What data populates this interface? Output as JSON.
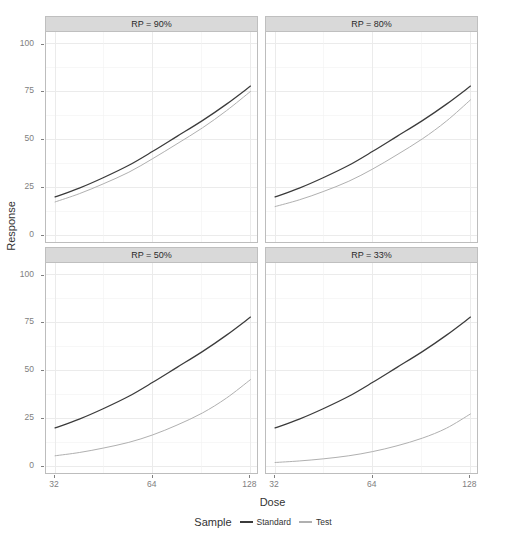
{
  "chart_data": {
    "type": "line",
    "title": "",
    "xlabel": "Dose",
    "ylabel": "Response",
    "xscale": "log2",
    "xlim": [
      30,
      136
    ],
    "ylim": [
      -4,
      106
    ],
    "x_ticks": [
      32,
      64,
      128
    ],
    "x_tick_labels": [
      "32",
      "64",
      "128"
    ],
    "y_ticks": [
      0,
      25,
      50,
      75,
      100
    ],
    "y_tick_labels": [
      "0",
      "25",
      "50",
      "75",
      "100"
    ],
    "grid": true,
    "legend_position": "bottom",
    "legend_title": "Sample",
    "facet_variable": "RP",
    "series_names": [
      "Standard",
      "Test"
    ],
    "series_colors": [
      "#3b3b3b",
      "#b0b0b0"
    ],
    "facets": [
      {
        "label": "RP = 90%",
        "row": 0,
        "col": 0,
        "series": [
          {
            "name": "Standard",
            "color": "#3b3b3b",
            "x": [
              32,
              38,
              45,
              54,
              64,
              76,
              91,
              108,
              128
            ],
            "y": [
              20.0,
              24.6,
              30.0,
              36.5,
              43.8,
              51.6,
              59.8,
              68.4,
              77.8
            ]
          },
          {
            "name": "Test",
            "color": "#b0b0b0",
            "x": [
              32,
              38,
              45,
              54,
              64,
              76,
              91,
              108,
              128
            ],
            "y": [
              17.4,
              21.7,
              26.8,
              32.9,
              40.0,
              47.7,
              56.0,
              65.0,
              75.0
            ]
          }
        ]
      },
      {
        "label": "RP = 80%",
        "row": 0,
        "col": 1,
        "series": [
          {
            "name": "Standard",
            "color": "#3b3b3b",
            "x": [
              32,
              38,
              45,
              54,
              64,
              76,
              91,
              108,
              128
            ],
            "y": [
              20.0,
              24.6,
              30.0,
              36.5,
              43.8,
              51.6,
              59.8,
              68.4,
              77.8
            ]
          },
          {
            "name": "Test",
            "color": "#b0b0b0",
            "x": [
              32,
              38,
              45,
              54,
              64,
              76,
              91,
              108,
              128
            ],
            "y": [
              15.0,
              18.5,
              22.8,
              28.2,
              34.6,
              42.0,
              50.3,
              59.6,
              70.6
            ]
          }
        ]
      },
      {
        "label": "RP = 50%",
        "row": 1,
        "col": 0,
        "series": [
          {
            "name": "Standard",
            "color": "#3b3b3b",
            "x": [
              32,
              38,
              45,
              54,
              64,
              76,
              91,
              108,
              128
            ],
            "y": [
              20.0,
              24.6,
              30.0,
              36.5,
              43.8,
              51.6,
              59.8,
              68.4,
              77.8
            ]
          },
          {
            "name": "Test",
            "color": "#b0b0b0",
            "x": [
              32,
              38,
              45,
              54,
              64,
              76,
              91,
              108,
              128
            ],
            "y": [
              5.5,
              7.2,
              9.5,
              12.5,
              16.4,
              21.5,
              27.8,
              35.6,
              45.2
            ]
          }
        ]
      },
      {
        "label": "RP = 33%",
        "row": 1,
        "col": 1,
        "series": [
          {
            "name": "Standard",
            "color": "#3b3b3b",
            "x": [
              32,
              38,
              45,
              54,
              64,
              76,
              91,
              108,
              128
            ],
            "y": [
              20.0,
              24.6,
              30.0,
              36.5,
              43.8,
              51.6,
              59.8,
              68.4,
              77.8
            ]
          },
          {
            "name": "Test",
            "color": "#b0b0b0",
            "x": [
              32,
              38,
              45,
              54,
              64,
              76,
              91,
              108,
              128
            ],
            "y": [
              2.0,
              2.8,
              3.9,
              5.5,
              7.7,
              10.7,
              14.7,
              19.9,
              27.3
            ]
          }
        ]
      }
    ]
  },
  "axes": {
    "y_title": "Response",
    "x_title": "Dose"
  },
  "legend": {
    "title": "Sample",
    "items": [
      {
        "label": "Standard",
        "color": "#3b3b3b"
      },
      {
        "label": "Test",
        "color": "#b0b0b0"
      }
    ]
  }
}
